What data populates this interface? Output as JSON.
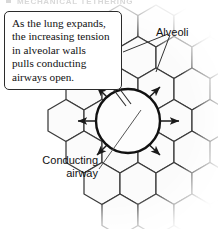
{
  "figure": {
    "width": 218,
    "height": 229,
    "background": "#ffffff",
    "section_heading": "MECHANICAL TETHERING"
  },
  "callout": {
    "name": "explanatory-callout",
    "lines": [
      "As the lung expands,",
      "the increasing tension",
      "in alveolar walls",
      "pulls conducting",
      "airways open."
    ],
    "full_text": "As the lung expands, the increasing tension in alveolar walls pulls conducting airways open.",
    "border_color": "#2b2b2b",
    "fill_color": "#ffffff"
  },
  "labels": {
    "alveoli": "Alveoli",
    "conducting_airway_line1": "Conducting",
    "conducting_airway_line2": "airway",
    "conducting_airway": "Conducting airway"
  },
  "colors": {
    "hex_stroke": "#3a3a3a",
    "hex_fill": "#fbfbfb",
    "circle_stroke": "#111111",
    "circle_fill": "#fdfdfd",
    "arrow_color": "#1a1a1a",
    "leader_color": "#555555",
    "text_color": "#111111",
    "heading_color": "#b9b9b9"
  },
  "diagram": {
    "type": "anatomical-schematic",
    "central_structure": "conducting airway",
    "surrounding_structure": "alveoli honeycomb",
    "radial_arrow_count": 6,
    "arrow_direction": "outward from conducting airway",
    "alveoli_leader_count": 2
  }
}
